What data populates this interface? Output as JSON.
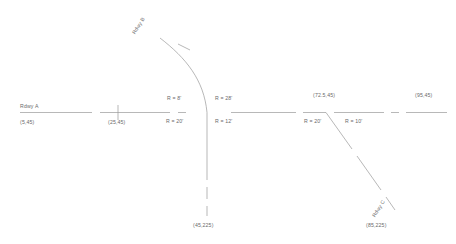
{
  "drawing": {
    "title": "Roadway intersection geometry plan",
    "stroke_color": "#9a9a9a",
    "text_color": "#6a6a6a",
    "background": "#ffffff"
  },
  "roadways": {
    "a": {
      "label": "Rdwy A"
    },
    "b": {
      "label": "Rdwy B"
    },
    "c": {
      "label": "Rdwy C"
    }
  },
  "radii": {
    "b_nw": "R = 8'",
    "b_ne": "R = 28'",
    "b_sw": "R = 20'",
    "b_se": "R = 12'",
    "c_sw": "R = 20'",
    "c_se": "R = 10'"
  },
  "coordinates": {
    "a_start": "(5,45)",
    "a_tick": "(25,45)",
    "c_station": "(72.5,45)",
    "a_end": "(95,45)",
    "b_end": "(45,225)",
    "c_end": "(85,225)"
  }
}
